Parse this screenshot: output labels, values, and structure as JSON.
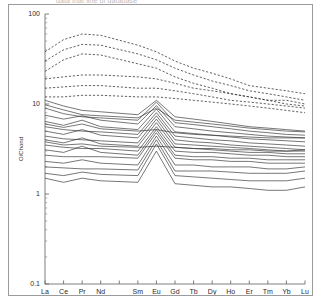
{
  "figure": {
    "caption_partial": "data that line of database",
    "panel_name": "ree-spider-diagram"
  },
  "chart_data": {
    "type": "line",
    "title": "",
    "xlabel": "",
    "ylabel": "O/Chond",
    "yscale": "log",
    "ylim": [
      0.1,
      100
    ],
    "ytick_labels": [
      "100",
      "10",
      "1",
      "0.1"
    ],
    "ytick_values": [
      100,
      10,
      1,
      0.1
    ],
    "grid": false,
    "legend": "none",
    "categories": [
      "La",
      "Ce",
      "Pr",
      "Nd",
      "Pm",
      "Sm",
      "Eu",
      "Gd",
      "Tb",
      "Dy",
      "Ho",
      "Er",
      "Tm",
      "Yb",
      "Lu"
    ],
    "xtick_labels": [
      "La",
      "Ce",
      "Pr",
      "Nd",
      "",
      "Sm",
      "Eu",
      "Gd",
      "Tb",
      "Dy",
      "Ho",
      "Er",
      "Tm",
      "Yb",
      "Lu"
    ],
    "series": [
      {
        "name": "dashed-1",
        "style": "dashed",
        "values": [
          38,
          52,
          60,
          58,
          null,
          45,
          38,
          30,
          25,
          22,
          19,
          16,
          15,
          14,
          13
        ]
      },
      {
        "name": "dashed-2",
        "style": "dashed",
        "values": [
          30,
          40,
          46,
          45,
          null,
          36,
          31,
          25,
          21,
          18,
          16,
          14,
          13,
          12,
          11
        ]
      },
      {
        "name": "dashed-3",
        "style": "dashed",
        "values": [
          23,
          31,
          36,
          35,
          null,
          28,
          25,
          20,
          17,
          15,
          13,
          12,
          11,
          10,
          9.5
        ]
      },
      {
        "name": "dashed-4",
        "style": "dashed",
        "values": [
          19,
          20,
          21,
          21,
          null,
          20,
          19,
          17,
          15,
          14,
          13,
          12,
          11,
          11,
          10
        ]
      },
      {
        "name": "dashed-5",
        "style": "dashed",
        "values": [
          15,
          15.5,
          16,
          16,
          null,
          15,
          15,
          14,
          13,
          12,
          11,
          10.5,
          10,
          9.5,
          9
        ]
      },
      {
        "name": "dashed-6",
        "style": "dashed",
        "values": [
          12,
          12,
          12.5,
          12.5,
          null,
          12,
          12,
          11.5,
          11,
          10.5,
          10,
          9.5,
          9,
          8.5,
          8
        ]
      },
      {
        "name": "solid-1",
        "style": "solid",
        "values": [
          11,
          9.5,
          8.5,
          8.2,
          null,
          7.6,
          11,
          7.2,
          6.8,
          6.4,
          6.0,
          5.6,
          5.4,
          5.2,
          5.0
        ]
      },
      {
        "name": "solid-2",
        "style": "solid",
        "values": [
          9.0,
          7.8,
          7.2,
          7.0,
          null,
          6.6,
          10.5,
          6.2,
          5.9,
          5.6,
          5.3,
          5.0,
          4.8,
          4.6,
          4.5
        ]
      },
      {
        "name": "solid-3",
        "style": "solid",
        "values": [
          7.5,
          6.8,
          7.4,
          6.6,
          null,
          6.0,
          9.6,
          5.6,
          5.3,
          5.0,
          4.8,
          4.6,
          4.4,
          4.3,
          4.2
        ]
      },
      {
        "name": "solid-4",
        "style": "solid",
        "values": [
          6.4,
          5.8,
          6.6,
          5.6,
          null,
          5.2,
          8.8,
          4.9,
          4.7,
          4.5,
          4.3,
          4.1,
          4.0,
          3.9,
          3.8
        ]
      },
      {
        "name": "solid-5",
        "style": "solid",
        "values": [
          5.6,
          5.2,
          5.0,
          4.9,
          null,
          4.6,
          8.0,
          4.4,
          4.2,
          4.0,
          3.9,
          3.7,
          3.6,
          3.5,
          3.4
        ]
      },
      {
        "name": "solid-6",
        "style": "solid",
        "values": [
          5.0,
          4.6,
          5.2,
          4.5,
          null,
          4.2,
          7.4,
          4.0,
          3.8,
          3.7,
          3.5,
          3.4,
          3.3,
          3.2,
          3.1
        ]
      },
      {
        "name": "solid-7",
        "style": "solid",
        "values": [
          4.4,
          4.1,
          4.0,
          3.9,
          null,
          3.7,
          6.8,
          3.6,
          3.5,
          3.4,
          3.3,
          3.2,
          3.1,
          3.0,
          3.0
        ]
      },
      {
        "name": "solid-8",
        "style": "solid",
        "values": [
          4.0,
          3.7,
          4.2,
          3.6,
          null,
          3.4,
          6.2,
          3.3,
          3.2,
          3.1,
          3.0,
          2.9,
          2.9,
          2.8,
          2.8
        ]
      },
      {
        "name": "solid-9",
        "style": "solid",
        "values": [
          3.5,
          3.3,
          3.2,
          3.2,
          null,
          3.0,
          5.6,
          3.0,
          2.9,
          2.9,
          2.8,
          2.7,
          2.7,
          2.6,
          2.6
        ]
      },
      {
        "name": "solid-10",
        "style": "solid",
        "values": [
          3.1,
          2.9,
          3.4,
          2.9,
          null,
          2.7,
          5.2,
          2.7,
          2.6,
          2.6,
          2.5,
          2.5,
          2.4,
          2.4,
          2.4
        ]
      },
      {
        "name": "solid-11",
        "style": "solid",
        "values": [
          2.7,
          2.6,
          2.6,
          2.6,
          null,
          2.5,
          4.8,
          2.5,
          2.4,
          2.4,
          2.3,
          2.3,
          2.2,
          2.2,
          2.2
        ]
      },
      {
        "name": "solid-12",
        "style": "solid",
        "values": [
          2.3,
          2.2,
          2.4,
          2.2,
          null,
          2.1,
          4.4,
          2.1,
          2.1,
          2.0,
          2.0,
          2.0,
          1.9,
          1.9,
          2.0
        ]
      },
      {
        "name": "solid-13",
        "style": "solid",
        "values": [
          2.0,
          1.95,
          1.9,
          1.9,
          null,
          1.85,
          4.0,
          1.8,
          1.8,
          1.8,
          1.75,
          1.7,
          1.7,
          1.7,
          1.8
        ]
      },
      {
        "name": "solid-14",
        "style": "solid",
        "values": [
          1.7,
          1.6,
          1.75,
          1.65,
          null,
          1.6,
          3.6,
          1.6,
          1.55,
          1.5,
          1.45,
          1.4,
          1.4,
          1.4,
          1.5
        ]
      },
      {
        "name": "solid-15",
        "style": "solid",
        "values": [
          1.5,
          1.35,
          1.5,
          1.4,
          null,
          1.35,
          3.0,
          1.3,
          1.25,
          1.2,
          1.2,
          1.15,
          1.1,
          1.1,
          1.2
        ]
      },
      {
        "name": "solid-16",
        "style": "solid",
        "values": [
          9.8,
          8.6,
          7.6,
          7.4,
          null,
          7.0,
          9.0,
          6.6,
          6.3,
          6.0,
          5.7,
          5.4,
          5.2,
          5.0,
          4.9
        ]
      },
      {
        "name": "solid-17",
        "style": "solid",
        "values": [
          6.0,
          5.5,
          6.0,
          5.3,
          null,
          5.0,
          5.2,
          4.8,
          4.6,
          4.5,
          4.4,
          4.3,
          4.2,
          4.2,
          4.2
        ]
      },
      {
        "name": "solid-18",
        "style": "solid",
        "values": [
          3.8,
          3.5,
          3.6,
          3.4,
          null,
          3.3,
          3.4,
          3.3,
          3.2,
          3.2,
          3.1,
          3.1,
          3.0,
          3.0,
          3.1
        ]
      }
    ]
  }
}
